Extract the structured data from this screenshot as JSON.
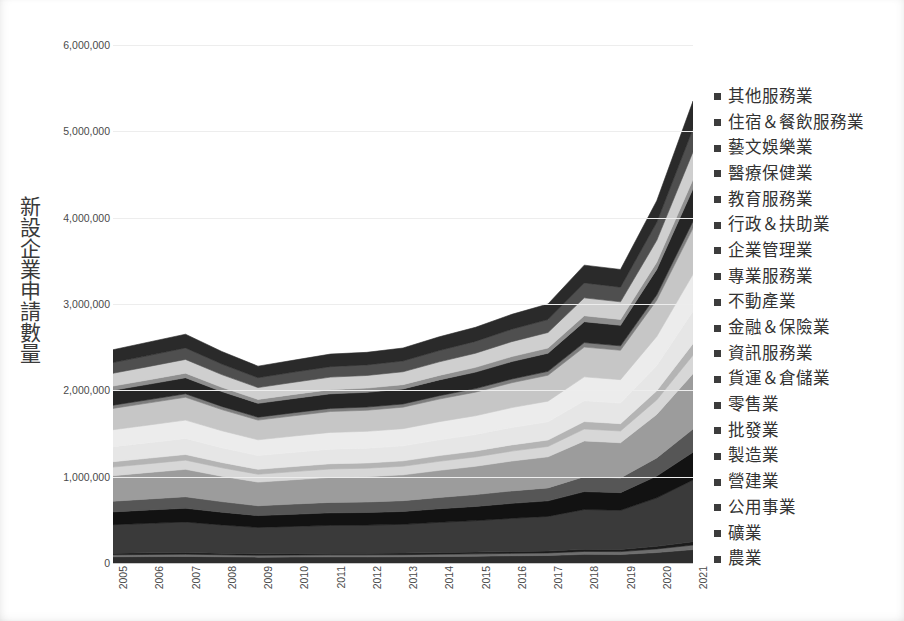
{
  "chart_data": {
    "type": "area",
    "stacked": true,
    "title": "",
    "xlabel": "",
    "ylabel": "新設企業申請數量",
    "x": [
      2005,
      2006,
      2007,
      2008,
      2009,
      2010,
      2011,
      2012,
      2013,
      2014,
      2015,
      2016,
      2017,
      2018,
      2019,
      2020,
      2021
    ],
    "categories": [
      "2005",
      "2006",
      "2007",
      "2008",
      "2009",
      "2010",
      "2011",
      "2012",
      "2013",
      "2014",
      "2015",
      "2016",
      "2017",
      "2018",
      "2019",
      "2020",
      "2021"
    ],
    "ylim": [
      0,
      6000000
    ],
    "ytick_labels": [
      "0",
      "1,000,000",
      "2,000,000",
      "3,000,000",
      "4,000,000",
      "5,000,000",
      "6,000,000"
    ],
    "ytick_values": [
      0,
      1000000,
      2000000,
      3000000,
      4000000,
      5000000,
      6000000
    ],
    "grid": true,
    "legend_position": "right",
    "legend_reversed": true,
    "totals": [
      2470000,
      2560000,
      2650000,
      2450000,
      2280000,
      2350000,
      2420000,
      2440000,
      2490000,
      2620000,
      2730000,
      2880000,
      3000000,
      3450000,
      3400000,
      4200000,
      5350000
    ],
    "series": [
      {
        "name": "農業",
        "color": "#2e2e2e",
        "values": [
          72000,
          74000,
          76000,
          72000,
          68000,
          70000,
          71000,
          71000,
          72000,
          76000,
          79000,
          84000,
          87000,
          100000,
          98000,
          121000,
          155000
        ]
      },
      {
        "name": "礦業",
        "color": "#6e6e6e",
        "values": [
          24000,
          25000,
          26000,
          24000,
          22000,
          23000,
          24000,
          24000,
          25000,
          26000,
          27000,
          28000,
          30000,
          34000,
          34000,
          42000,
          53000
        ]
      },
      {
        "name": "公用事業",
        "color": "#1c1c1c",
        "values": [
          18000,
          19000,
          19000,
          18000,
          17000,
          17000,
          18000,
          18000,
          18000,
          19000,
          20000,
          21000,
          22000,
          25000,
          25000,
          31000,
          39000
        ]
      },
      {
        "name": "營建業",
        "color": "#3a3a3a",
        "values": [
          330000,
          342000,
          354000,
          327000,
          305000,
          314000,
          323000,
          326000,
          333000,
          350000,
          365000,
          385000,
          401000,
          461000,
          454000,
          561000,
          715000
        ]
      },
      {
        "name": "製造業",
        "color": "#121212",
        "values": [
          148000,
          154000,
          159000,
          147000,
          137000,
          141000,
          145000,
          146000,
          149000,
          157000,
          164000,
          173000,
          180000,
          207000,
          204000,
          252000,
          321000
        ]
      },
      {
        "name": "批發業",
        "color": "#565656",
        "values": [
          124000,
          128000,
          133000,
          123000,
          114000,
          118000,
          121000,
          122000,
          125000,
          131000,
          137000,
          144000,
          150000,
          173000,
          170000,
          210000,
          268000
        ]
      },
      {
        "name": "零售業",
        "color": "#9c9c9c",
        "values": [
          296000,
          307000,
          318000,
          294000,
          274000,
          282000,
          290000,
          293000,
          299000,
          314000,
          328000,
          346000,
          360000,
          414000,
          408000,
          504000,
          642000
        ]
      },
      {
        "name": "貨運＆倉儲業",
        "color": "#d7d7d7",
        "values": [
          99000,
          102000,
          106000,
          98000,
          91000,
          94000,
          97000,
          98000,
          100000,
          105000,
          109000,
          115000,
          120000,
          138000,
          136000,
          168000,
          214000
        ]
      },
      {
        "name": "資訊服務業",
        "color": "#b4b4b4",
        "values": [
          62000,
          64000,
          66000,
          61000,
          57000,
          59000,
          61000,
          61000,
          62000,
          66000,
          68000,
          72000,
          75000,
          86000,
          85000,
          105000,
          134000
        ]
      },
      {
        "name": "金融＆保險業",
        "color": "#e6e6e6",
        "values": [
          173000,
          179000,
          186000,
          172000,
          160000,
          165000,
          169000,
          171000,
          174000,
          183000,
          191000,
          202000,
          210000,
          242000,
          238000,
          294000,
          375000
        ]
      },
      {
        "name": "不動產業",
        "color": "#ececec",
        "values": [
          198000,
          205000,
          212000,
          196000,
          182000,
          188000,
          194000,
          195000,
          199000,
          210000,
          218000,
          230000,
          240000,
          276000,
          272000,
          336000,
          428000
        ]
      },
      {
        "name": "專業服務業",
        "color": "#c6c6c6",
        "values": [
          247000,
          256000,
          265000,
          245000,
          228000,
          235000,
          242000,
          244000,
          249000,
          262000,
          273000,
          288000,
          300000,
          345000,
          340000,
          420000,
          535000
        ]
      },
      {
        "name": "企業管理業",
        "color": "#7d7d7d",
        "values": [
          37000,
          38000,
          40000,
          37000,
          34000,
          35000,
          36000,
          37000,
          37000,
          39000,
          41000,
          43000,
          45000,
          52000,
          51000,
          63000,
          80000
        ]
      },
      {
        "name": "行政＆扶助業",
        "color": "#252525",
        "values": [
          173000,
          179000,
          186000,
          172000,
          160000,
          165000,
          169000,
          171000,
          174000,
          183000,
          191000,
          202000,
          210000,
          242000,
          238000,
          294000,
          375000
        ]
      },
      {
        "name": "教育服務業",
        "color": "#8f8f8f",
        "values": [
          49000,
          51000,
          53000,
          49000,
          46000,
          47000,
          48000,
          49000,
          50000,
          52000,
          55000,
          58000,
          60000,
          69000,
          68000,
          84000,
          107000
        ]
      },
      {
        "name": "醫療保健業",
        "color": "#cfcfcf",
        "values": [
          148000,
          154000,
          159000,
          147000,
          137000,
          141000,
          145000,
          146000,
          149000,
          157000,
          164000,
          173000,
          180000,
          207000,
          204000,
          252000,
          321000
        ]
      },
      {
        "name": "住宿＆餐飲服務業",
        "color": "#4f4f4f",
        "values": [
          124000,
          128000,
          133000,
          123000,
          114000,
          118000,
          121000,
          122000,
          125000,
          131000,
          137000,
          144000,
          150000,
          173000,
          170000,
          210000,
          268000
        ]
      },
      {
        "name": "其他服務業",
        "color": "#2a2a2a",
        "values": [
          148000,
          155000,
          159000,
          145000,
          134000,
          138000,
          146000,
          146000,
          150000,
          159000,
          163000,
          172000,
          180000,
          206000,
          205000,
          249000,
          320000
        ]
      }
    ]
  },
  "legend": {
    "items": [
      {
        "label": "其他服務業"
      },
      {
        "label": "住宿＆餐飲服務業"
      },
      {
        "label": "藝文娛樂業"
      },
      {
        "label": "醫療保健業"
      },
      {
        "label": "教育服務業"
      },
      {
        "label": "行政＆扶助業"
      },
      {
        "label": "企業管理業"
      },
      {
        "label": "專業服務業"
      },
      {
        "label": "不動產業"
      },
      {
        "label": "金融＆保險業"
      },
      {
        "label": "資訊服務業"
      },
      {
        "label": "貨運＆倉儲業"
      },
      {
        "label": "零售業"
      },
      {
        "label": "批發業"
      },
      {
        "label": "製造業"
      },
      {
        "label": "營建業"
      },
      {
        "label": "公用事業"
      },
      {
        "label": "礦業"
      },
      {
        "label": "農業"
      }
    ]
  }
}
